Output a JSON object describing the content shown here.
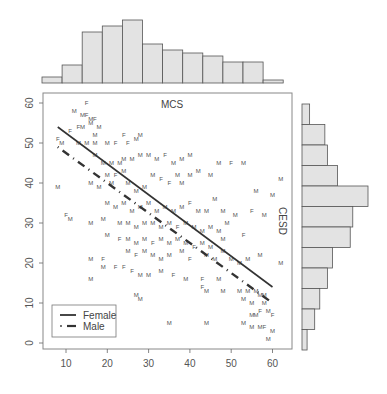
{
  "chart_data": [
    {
      "type": "scatter",
      "title": "MCS",
      "xlabel": "MCS",
      "ylabel": "CESD",
      "xlim": [
        5,
        64
      ],
      "ylim": [
        -1,
        62
      ],
      "xticks": [
        10,
        20,
        30,
        40,
        50,
        60
      ],
      "yticks": [
        0,
        10,
        20,
        30,
        40,
        50,
        60
      ],
      "grid": false,
      "legend_position": "bottom-left",
      "legend": [
        {
          "label": "Female",
          "style": "solid"
        },
        {
          "label": "Male",
          "style": "dot-dash"
        }
      ],
      "regression_lines": [
        {
          "name": "Female",
          "style": "solid",
          "x": [
            8,
            60
          ],
          "y": [
            54,
            14
          ]
        },
        {
          "name": "Male",
          "style": "dot-dash",
          "x": [
            8,
            60
          ],
          "y": [
            49,
            10
          ]
        }
      ],
      "points": [
        {
          "x": 8,
          "y": 51,
          "g": "F"
        },
        {
          "x": 9,
          "y": 50,
          "g": "M"
        },
        {
          "x": 8,
          "y": 39,
          "g": "M"
        },
        {
          "x": 12,
          "y": 58,
          "g": "M"
        },
        {
          "x": 15,
          "y": 60,
          "g": "F"
        },
        {
          "x": 14,
          "y": 57,
          "g": "M"
        },
        {
          "x": 15,
          "y": 57,
          "g": "F"
        },
        {
          "x": 16,
          "y": 56,
          "g": "M"
        },
        {
          "x": 17,
          "y": 56,
          "g": "F"
        },
        {
          "x": 13,
          "y": 54,
          "g": "F"
        },
        {
          "x": 14,
          "y": 54,
          "g": "M"
        },
        {
          "x": 16,
          "y": 55,
          "g": "M"
        },
        {
          "x": 18,
          "y": 54,
          "g": "M"
        },
        {
          "x": 11,
          "y": 53,
          "g": "F"
        },
        {
          "x": 17,
          "y": 52,
          "g": "M"
        },
        {
          "x": 13,
          "y": 50,
          "g": "M"
        },
        {
          "x": 15,
          "y": 50,
          "g": "M"
        },
        {
          "x": 17,
          "y": 50,
          "g": "M"
        },
        {
          "x": 20,
          "y": 50,
          "g": "M"
        },
        {
          "x": 22,
          "y": 50,
          "g": "F"
        },
        {
          "x": 25,
          "y": 50,
          "g": "F"
        },
        {
          "x": 24,
          "y": 52,
          "g": "F"
        },
        {
          "x": 27,
          "y": 51,
          "g": "M"
        },
        {
          "x": 28,
          "y": 52,
          "g": "M"
        },
        {
          "x": 17,
          "y": 47,
          "g": "M"
        },
        {
          "x": 19,
          "y": 45,
          "g": "M"
        },
        {
          "x": 21,
          "y": 45,
          "g": "M"
        },
        {
          "x": 23,
          "y": 45,
          "g": "M"
        },
        {
          "x": 24,
          "y": 46,
          "g": "M"
        },
        {
          "x": 26,
          "y": 46,
          "g": "M"
        },
        {
          "x": 28,
          "y": 47,
          "g": "M"
        },
        {
          "x": 20,
          "y": 42,
          "g": "M"
        },
        {
          "x": 22,
          "y": 42,
          "g": "F"
        },
        {
          "x": 24,
          "y": 43,
          "g": "M"
        },
        {
          "x": 16,
          "y": 40,
          "g": "M"
        },
        {
          "x": 18,
          "y": 39,
          "g": "M"
        },
        {
          "x": 21,
          "y": 40,
          "g": "M"
        },
        {
          "x": 25,
          "y": 40,
          "g": "M"
        },
        {
          "x": 27,
          "y": 38,
          "g": "M"
        },
        {
          "x": 29,
          "y": 39,
          "g": "M"
        },
        {
          "x": 31,
          "y": 42,
          "g": "M"
        },
        {
          "x": 33,
          "y": 41,
          "g": "F"
        },
        {
          "x": 35,
          "y": 40,
          "g": "F"
        },
        {
          "x": 37,
          "y": 42,
          "g": "M"
        },
        {
          "x": 38,
          "y": 40,
          "g": "M"
        },
        {
          "x": 40,
          "y": 42,
          "g": "M"
        },
        {
          "x": 42,
          "y": 43,
          "g": "M"
        },
        {
          "x": 30,
          "y": 47,
          "g": "M"
        },
        {
          "x": 32,
          "y": 46,
          "g": "M"
        },
        {
          "x": 34,
          "y": 47,
          "g": "F"
        },
        {
          "x": 36,
          "y": 45,
          "g": "M"
        },
        {
          "x": 38,
          "y": 46,
          "g": "M"
        },
        {
          "x": 40,
          "y": 47,
          "g": "M"
        },
        {
          "x": 45,
          "y": 42,
          "g": "M"
        },
        {
          "x": 47,
          "y": 45,
          "g": "M"
        },
        {
          "x": 50,
          "y": 45,
          "g": "F"
        },
        {
          "x": 53,
          "y": 45,
          "g": "M"
        },
        {
          "x": 56,
          "y": 38,
          "g": "M"
        },
        {
          "x": 62,
          "y": 41,
          "g": "M"
        },
        {
          "x": 55,
          "y": 33,
          "g": "F"
        },
        {
          "x": 60,
          "y": 37,
          "g": "M"
        },
        {
          "x": 58,
          "y": 32,
          "g": "M"
        },
        {
          "x": 20,
          "y": 35,
          "g": "M"
        },
        {
          "x": 22,
          "y": 34,
          "g": "M"
        },
        {
          "x": 24,
          "y": 35,
          "g": "M"
        },
        {
          "x": 26,
          "y": 33,
          "g": "M"
        },
        {
          "x": 28,
          "y": 34,
          "g": "M"
        },
        {
          "x": 30,
          "y": 35,
          "g": "M"
        },
        {
          "x": 32,
          "y": 33,
          "g": "M"
        },
        {
          "x": 34,
          "y": 34,
          "g": "M"
        },
        {
          "x": 36,
          "y": 33,
          "g": "M"
        },
        {
          "x": 38,
          "y": 34,
          "g": "M"
        },
        {
          "x": 40,
          "y": 35,
          "g": "F"
        },
        {
          "x": 42,
          "y": 33,
          "g": "M"
        },
        {
          "x": 44,
          "y": 33,
          "g": "M"
        },
        {
          "x": 46,
          "y": 36,
          "g": "M"
        },
        {
          "x": 48,
          "y": 33,
          "g": "M"
        },
        {
          "x": 19,
          "y": 31,
          "g": "M"
        },
        {
          "x": 11,
          "y": 31,
          "g": "M"
        },
        {
          "x": 10,
          "y": 32,
          "g": "F"
        },
        {
          "x": 16,
          "y": 30,
          "g": "M"
        },
        {
          "x": 23,
          "y": 30,
          "g": "M"
        },
        {
          "x": 25,
          "y": 30,
          "g": "M"
        },
        {
          "x": 27,
          "y": 29,
          "g": "M"
        },
        {
          "x": 29,
          "y": 30,
          "g": "M"
        },
        {
          "x": 31,
          "y": 30,
          "g": "M"
        },
        {
          "x": 33,
          "y": 29,
          "g": "M"
        },
        {
          "x": 35,
          "y": 30,
          "g": "M"
        },
        {
          "x": 37,
          "y": 29,
          "g": "F"
        },
        {
          "x": 39,
          "y": 30,
          "g": "M"
        },
        {
          "x": 41,
          "y": 29,
          "g": "M"
        },
        {
          "x": 43,
          "y": 28,
          "g": "M"
        },
        {
          "x": 45,
          "y": 29,
          "g": "M"
        },
        {
          "x": 47,
          "y": 28,
          "g": "M"
        },
        {
          "x": 49,
          "y": 30,
          "g": "M"
        },
        {
          "x": 51,
          "y": 32,
          "g": "M"
        },
        {
          "x": 53,
          "y": 27,
          "g": "F"
        },
        {
          "x": 20,
          "y": 27,
          "g": "M"
        },
        {
          "x": 23,
          "y": 26,
          "g": "F"
        },
        {
          "x": 25,
          "y": 26,
          "g": "M"
        },
        {
          "x": 27,
          "y": 25,
          "g": "M"
        },
        {
          "x": 29,
          "y": 26,
          "g": "M"
        },
        {
          "x": 31,
          "y": 25,
          "g": "F"
        },
        {
          "x": 33,
          "y": 26,
          "g": "M"
        },
        {
          "x": 35,
          "y": 25,
          "g": "M"
        },
        {
          "x": 37,
          "y": 26,
          "g": "M"
        },
        {
          "x": 39,
          "y": 25,
          "g": "M"
        },
        {
          "x": 41,
          "y": 24,
          "g": "F"
        },
        {
          "x": 43,
          "y": 25,
          "g": "M"
        },
        {
          "x": 45,
          "y": 24,
          "g": "M"
        },
        {
          "x": 48,
          "y": 26,
          "g": "M"
        },
        {
          "x": 25,
          "y": 23,
          "g": "M"
        },
        {
          "x": 27,
          "y": 22,
          "g": "F"
        },
        {
          "x": 29,
          "y": 23,
          "g": "M"
        },
        {
          "x": 31,
          "y": 22,
          "g": "M"
        },
        {
          "x": 33,
          "y": 21,
          "g": "M"
        },
        {
          "x": 35,
          "y": 22,
          "g": "M"
        },
        {
          "x": 38,
          "y": 23,
          "g": "M"
        },
        {
          "x": 40,
          "y": 21,
          "g": "F"
        },
        {
          "x": 44,
          "y": 22,
          "g": "M"
        },
        {
          "x": 46,
          "y": 21,
          "g": "M"
        },
        {
          "x": 48,
          "y": 23,
          "g": "M"
        },
        {
          "x": 50,
          "y": 21,
          "g": "M"
        },
        {
          "x": 52,
          "y": 20,
          "g": "M"
        },
        {
          "x": 54,
          "y": 21,
          "g": "M"
        },
        {
          "x": 57,
          "y": 22,
          "g": "M"
        },
        {
          "x": 62,
          "y": 20,
          "g": "M"
        },
        {
          "x": 16,
          "y": 21,
          "g": "M"
        },
        {
          "x": 19,
          "y": 21,
          "g": "F"
        },
        {
          "x": 19,
          "y": 19,
          "g": "M"
        },
        {
          "x": 22,
          "y": 19,
          "g": "F"
        },
        {
          "x": 24,
          "y": 19,
          "g": "F"
        },
        {
          "x": 26,
          "y": 18,
          "g": "F"
        },
        {
          "x": 16,
          "y": 16,
          "g": "M"
        },
        {
          "x": 28,
          "y": 17,
          "g": "M"
        },
        {
          "x": 30,
          "y": 17,
          "g": "M"
        },
        {
          "x": 33,
          "y": 18,
          "g": "M"
        },
        {
          "x": 36,
          "y": 17,
          "g": "F"
        },
        {
          "x": 39,
          "y": 16,
          "g": "M"
        },
        {
          "x": 43,
          "y": 16,
          "g": "F"
        },
        {
          "x": 47,
          "y": 16,
          "g": "M"
        },
        {
          "x": 43,
          "y": 14,
          "g": "F"
        },
        {
          "x": 44,
          "y": 13,
          "g": "M"
        },
        {
          "x": 48,
          "y": 13,
          "g": "M"
        },
        {
          "x": 52,
          "y": 13,
          "g": "M"
        },
        {
          "x": 54,
          "y": 13,
          "g": "M"
        },
        {
          "x": 56,
          "y": 13,
          "g": "M"
        },
        {
          "x": 57,
          "y": 12,
          "g": "M"
        },
        {
          "x": 58,
          "y": 12,
          "g": "M"
        },
        {
          "x": 53,
          "y": 11,
          "g": "M"
        },
        {
          "x": 55,
          "y": 10,
          "g": "M"
        },
        {
          "x": 58,
          "y": 10,
          "g": "M"
        },
        {
          "x": 27,
          "y": 12,
          "g": "M"
        },
        {
          "x": 28,
          "y": 11,
          "g": "M"
        },
        {
          "x": 57,
          "y": 8,
          "g": "F"
        },
        {
          "x": 55,
          "y": 7,
          "g": "M"
        },
        {
          "x": 56,
          "y": 7,
          "g": "M"
        },
        {
          "x": 59,
          "y": 8,
          "g": "M"
        },
        {
          "x": 60,
          "y": 7,
          "g": "F"
        },
        {
          "x": 53,
          "y": 5,
          "g": "M"
        },
        {
          "x": 55,
          "y": 4,
          "g": "M"
        },
        {
          "x": 57,
          "y": 4,
          "g": "M"
        },
        {
          "x": 58,
          "y": 4,
          "g": "F"
        },
        {
          "x": 60,
          "y": 3,
          "g": "M"
        },
        {
          "x": 59,
          "y": 1,
          "g": "M"
        },
        {
          "x": 44,
          "y": 5,
          "g": "M"
        },
        {
          "x": 35,
          "y": 5,
          "g": "M"
        }
      ]
    },
    {
      "type": "bar",
      "title": "MCS marginal histogram",
      "orientation": "vertical",
      "categories": [
        "5-10",
        "10-15",
        "15-20",
        "20-25",
        "25-30",
        "30-35",
        "35-40",
        "40-45",
        "45-50",
        "50-55",
        "55-60",
        "60-65"
      ],
      "values": [
        2,
        6,
        17,
        19,
        21,
        13,
        11,
        10,
        9,
        7,
        7,
        1
      ]
    },
    {
      "type": "bar",
      "title": "CESD marginal histogram",
      "orientation": "horizontal",
      "categories": [
        "55-60",
        "50-55",
        "45-50",
        "40-45",
        "35-40",
        "30-35",
        "25-30",
        "20-25",
        "15-20",
        "10-15",
        "5-10",
        "0-5"
      ],
      "values": [
        3,
        9,
        10,
        14,
        26,
        20,
        19,
        12,
        10,
        7,
        5,
        2
      ]
    }
  ],
  "labels": {
    "title": "MCS",
    "ylabel": "CESD",
    "legend_female": "Female",
    "legend_male": "Male"
  }
}
